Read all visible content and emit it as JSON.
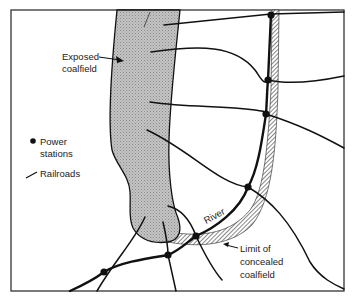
{
  "figure": {
    "labels": {
      "exposed_coalfield": [
        "Exposed",
        "coalfield"
      ],
      "river": "River",
      "concealed_limit": [
        "Limit of",
        "concealed",
        "coalfield"
      ]
    },
    "legend": {
      "items": [
        {
          "symbol": "dot-icon",
          "lines": [
            "Power",
            "stations"
          ]
        },
        {
          "symbol": "line-icon",
          "lines": [
            "Railroads"
          ]
        }
      ]
    },
    "colors": {
      "frame": "#333333",
      "coalfield_fill": "#b8b8b8",
      "lines": "#111111",
      "background": "#ffffff"
    },
    "counts": {
      "power_stations": 8
    }
  }
}
